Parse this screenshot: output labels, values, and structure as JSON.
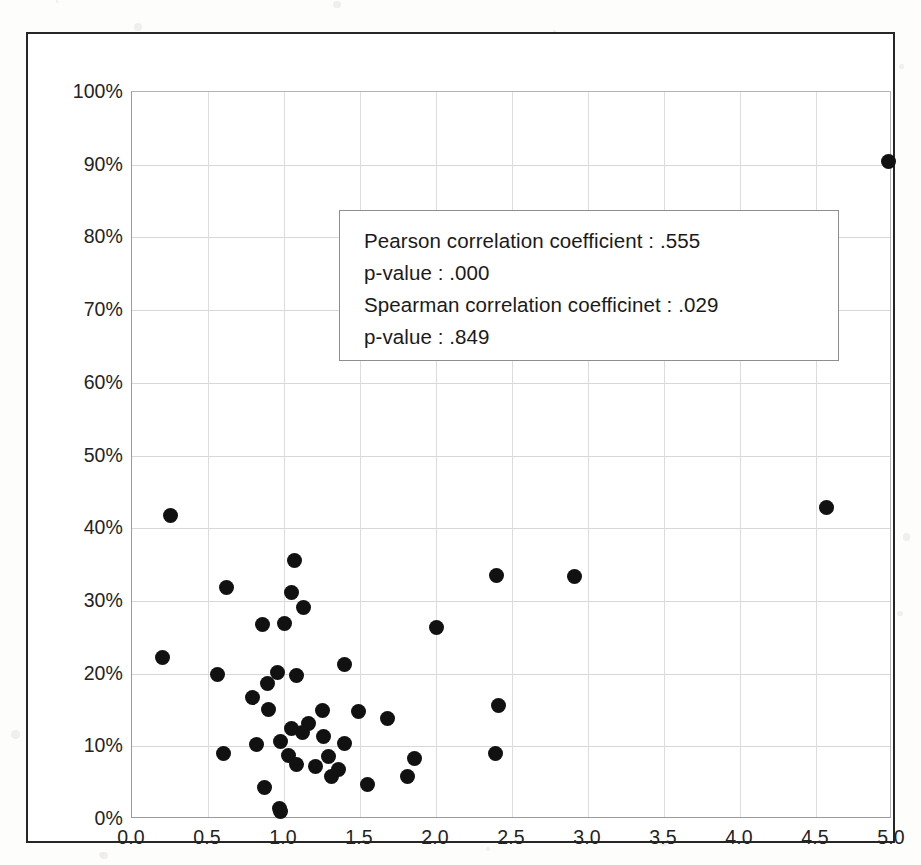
{
  "figure": {
    "background_color": "#ffffff",
    "frame_color": "#262626",
    "marker_color": "#111111",
    "gridline_color": "#d8d8d8"
  },
  "annotation": {
    "box_label": "correlation-statistics-box",
    "lines": [
      "Pearson correlation coefficient : .555",
      "p-value : .000",
      "Spearman correlation coefficinet : .029",
      "p-value : .849"
    ],
    "pearson_label": "Pearson correlation coefficient",
    "pearson_value": ".555",
    "pearson_p_label": "p-value",
    "pearson_p_value": ".000",
    "spearman_label": "Spearman correlation coefficinet",
    "spearman_value": ".029",
    "spearman_p_label": "p-value",
    "spearman_p_value": ".849"
  },
  "chart_data": {
    "type": "scatter",
    "title": "",
    "xlabel": "",
    "ylabel": "",
    "xlim": [
      0.0,
      5.0
    ],
    "ylim": [
      0,
      100
    ],
    "grid": true,
    "legend": "none",
    "xticks": [
      "0.0",
      "0.5",
      "1.0",
      "1.5",
      "2.0",
      "2.5",
      "3.0",
      "3.5",
      "4.0",
      "4.5",
      "5.0"
    ],
    "xtick_values": [
      0.0,
      0.5,
      1.0,
      1.5,
      2.0,
      2.5,
      3.0,
      3.5,
      4.0,
      4.5,
      5.0
    ],
    "yticks": [
      "0%",
      "10%",
      "20%",
      "30%",
      "40%",
      "50%",
      "60%",
      "70%",
      "80%",
      "90%",
      "100%"
    ],
    "ytick_values": [
      0,
      10,
      20,
      30,
      40,
      50,
      60,
      70,
      80,
      90,
      100
    ],
    "series": [
      {
        "name": "observations",
        "marker": "filled-circle",
        "color": "#111111",
        "points": [
          [
            4.98,
            90.5
          ],
          [
            4.57,
            42.8
          ],
          [
            0.25,
            41.7
          ],
          [
            1.07,
            35.6
          ],
          [
            2.4,
            33.5
          ],
          [
            2.91,
            33.3
          ],
          [
            0.62,
            31.8
          ],
          [
            1.05,
            31.2
          ],
          [
            1.13,
            29.1
          ],
          [
            0.86,
            26.8
          ],
          [
            1.0,
            26.9
          ],
          [
            2.0,
            26.3
          ],
          [
            0.2,
            22.2
          ],
          [
            1.4,
            21.2
          ],
          [
            0.56,
            19.9
          ],
          [
            1.08,
            19.8
          ],
          [
            0.96,
            20.1
          ],
          [
            0.89,
            18.6
          ],
          [
            0.79,
            16.7
          ],
          [
            2.41,
            15.6
          ],
          [
            0.9,
            15.1
          ],
          [
            1.25,
            14.9
          ],
          [
            1.49,
            14.8
          ],
          [
            1.68,
            13.8
          ],
          [
            1.16,
            13.1
          ],
          [
            1.05,
            12.5
          ],
          [
            1.12,
            11.9
          ],
          [
            1.26,
            11.3
          ],
          [
            0.98,
            10.6
          ],
          [
            1.4,
            10.4
          ],
          [
            0.82,
            10.3
          ],
          [
            0.6,
            9.0
          ],
          [
            2.39,
            9.0
          ],
          [
            1.03,
            8.8
          ],
          [
            1.29,
            8.6
          ],
          [
            1.86,
            8.3
          ],
          [
            1.08,
            7.5
          ],
          [
            1.21,
            7.2
          ],
          [
            1.36,
            6.8
          ],
          [
            1.31,
            5.9
          ],
          [
            1.81,
            5.9
          ],
          [
            1.55,
            4.8
          ],
          [
            0.87,
            4.4
          ],
          [
            0.97,
            1.5
          ],
          [
            0.98,
            1.0
          ]
        ]
      }
    ]
  }
}
